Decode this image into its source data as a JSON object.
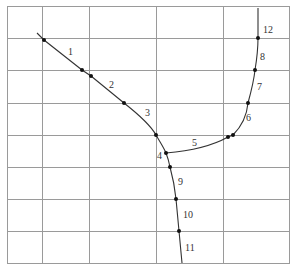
{
  "diagram": {
    "type": "grid-with-polyline-curves",
    "grid": {
      "left": 7,
      "right": 289,
      "top": 6,
      "bottom": 263,
      "vertical_lines": [
        42,
        89,
        156,
        223
      ],
      "horizontal_lines": [
        38,
        70,
        103,
        135,
        167,
        199,
        231
      ],
      "line_color": "#9a9a9a"
    },
    "curve_color": "#333333",
    "dot_color": "#111111",
    "curves": [
      {
        "name": "left-diagonal-branch",
        "d": "M37,33 L44,40 L82,70 L91,76 L124,103 C138,114 150,124 156,135 C160,142 164,148 166,153"
      },
      {
        "name": "right-rising-branch",
        "d": "M166,153 C190,151 212,146 228,137 L233,135 C242,126 247,114 248,103 C251,92 254,80 255,70 C257,58 258,48 258,38 L258,8"
      },
      {
        "name": "lower-descending-branch",
        "d": "M166,153 C168,158 169,162 170,167 C173,178 175,189 176,199 C177,210 178,220 179,231 C180,241 181,252 182,263"
      }
    ],
    "points": [
      {
        "x": 44,
        "y": 40
      },
      {
        "x": 82,
        "y": 70
      },
      {
        "x": 91,
        "y": 76
      },
      {
        "x": 124,
        "y": 103
      },
      {
        "x": 156,
        "y": 135
      },
      {
        "x": 166,
        "y": 153
      },
      {
        "x": 228,
        "y": 137
      },
      {
        "x": 233,
        "y": 135
      },
      {
        "x": 248,
        "y": 103
      },
      {
        "x": 255,
        "y": 70
      },
      {
        "x": 258,
        "y": 38
      },
      {
        "x": 170,
        "y": 167
      },
      {
        "x": 176,
        "y": 199
      },
      {
        "x": 179,
        "y": 231
      }
    ],
    "labels": [
      {
        "text": "1",
        "x": 68,
        "y": 55
      },
      {
        "text": "2",
        "x": 109,
        "y": 88
      },
      {
        "text": "3",
        "x": 145,
        "y": 116
      },
      {
        "text": "4",
        "x": 157,
        "y": 159
      },
      {
        "text": "5",
        "x": 192,
        "y": 146
      },
      {
        "text": "6",
        "x": 246,
        "y": 121
      },
      {
        "text": "7",
        "x": 257,
        "y": 90
      },
      {
        "text": "8",
        "x": 260,
        "y": 60
      },
      {
        "text": "9",
        "x": 178,
        "y": 185
      },
      {
        "text": "10",
        "x": 183,
        "y": 218
      },
      {
        "text": "11",
        "x": 185,
        "y": 251
      },
      {
        "text": "12",
        "x": 263,
        "y": 33
      }
    ]
  }
}
